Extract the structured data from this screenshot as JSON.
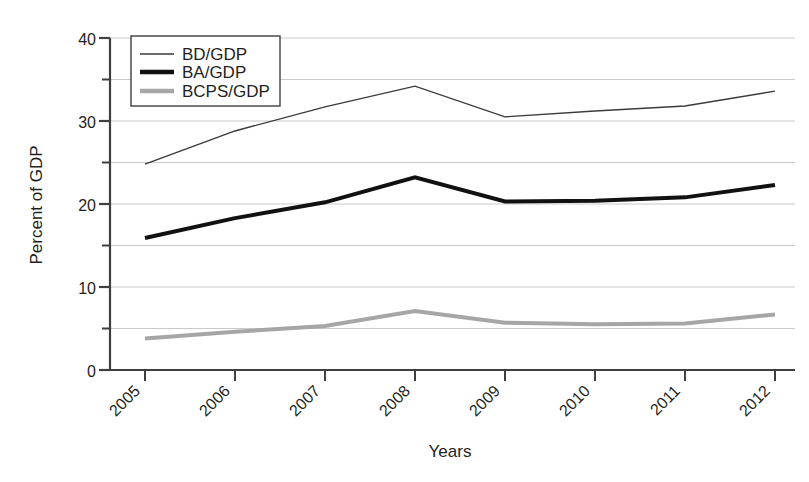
{
  "chart_data": {
    "type": "line",
    "title": "",
    "xlabel": "Years",
    "ylabel": "Percent of GDP",
    "categories": [
      "2005",
      "2006",
      "2007",
      "2008",
      "2009",
      "2010",
      "2011",
      "2012"
    ],
    "x": [
      2005,
      2006,
      2007,
      2008,
      2009,
      2010,
      2011,
      2012
    ],
    "xlim": [
      2005,
      2012
    ],
    "ylim": [
      0,
      40
    ],
    "y_ticks_major": [
      0,
      10,
      20,
      30,
      40
    ],
    "y_ticks_minor": [
      5,
      15,
      25,
      35
    ],
    "y_tick_labels": [
      "0",
      "10",
      "20",
      "30",
      "40"
    ],
    "grid": true,
    "grid_orientation": "horizontal",
    "legend_position": "top-left",
    "series": [
      {
        "name": "BD/GDP",
        "color": "#3a3a3a",
        "line_width": 1.4,
        "values": [
          24.8,
          28.8,
          31.7,
          34.2,
          30.5,
          31.2,
          31.8,
          33.6
        ]
      },
      {
        "name": "BA/GDP",
        "color": "#111111",
        "line_width": 4.0,
        "values": [
          15.9,
          18.3,
          20.2,
          23.2,
          20.3,
          20.4,
          20.8,
          22.3
        ]
      },
      {
        "name": "BCPS/GDP",
        "color": "#a6a6a6",
        "line_width": 4.0,
        "values": [
          3.8,
          4.6,
          5.3,
          7.1,
          5.7,
          5.5,
          5.6,
          6.7
        ]
      }
    ]
  },
  "axes": {
    "y_label": "Percent of GDP",
    "x_label": "Years",
    "y_tick_0": "0",
    "y_tick_10": "10",
    "y_tick_20": "20",
    "y_tick_30": "30",
    "y_tick_40": "40",
    "x_tick_2005": "2005",
    "x_tick_2006": "2006",
    "x_tick_2007": "2007",
    "x_tick_2008": "2008",
    "x_tick_2009": "2009",
    "x_tick_2010": "2010",
    "x_tick_2011": "2011",
    "x_tick_2012": "2012"
  },
  "legend": {
    "items": [
      {
        "label": "BD/GDP"
      },
      {
        "label": "BA/GDP"
      },
      {
        "label": "BCPS/GDP"
      }
    ]
  },
  "colors": {
    "series_bd": "#3a3a3a",
    "series_ba": "#111111",
    "series_bcps": "#a6a6a6",
    "axis": "#3f3f3f",
    "grid": "#c9c9c9",
    "background": "#ffffff"
  }
}
